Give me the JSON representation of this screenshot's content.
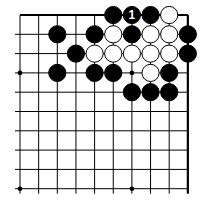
{
  "board": {
    "title": "Go problem diagram (corner)",
    "columns": 10,
    "rows": 10,
    "origin_x": 20,
    "origin_y": 15,
    "spacing_x": 18.65,
    "spacing_y": 19.3,
    "line_color": "#000000",
    "black_color": "#000000",
    "white_color": "#ffffff",
    "star_points": [
      [
        0,
        3
      ],
      [
        6,
        3
      ],
      [
        0,
        9
      ],
      [
        6,
        9
      ]
    ],
    "stones": [
      {
        "col": 5,
        "row": 0,
        "color": "black"
      },
      {
        "col": 6,
        "row": 0,
        "color": "black",
        "label": "1"
      },
      {
        "col": 7,
        "row": 0,
        "color": "black"
      },
      {
        "col": 8,
        "row": 0,
        "color": "white"
      },
      {
        "col": 2,
        "row": 1,
        "color": "black"
      },
      {
        "col": 4,
        "row": 1,
        "color": "black"
      },
      {
        "col": 5,
        "row": 1,
        "color": "white"
      },
      {
        "col": 6,
        "row": 1,
        "color": "black"
      },
      {
        "col": 7,
        "row": 1,
        "color": "white"
      },
      {
        "col": 8,
        "row": 1,
        "color": "white"
      },
      {
        "col": 9,
        "row": 1,
        "color": "black"
      },
      {
        "col": 3,
        "row": 2,
        "color": "black"
      },
      {
        "col": 4,
        "row": 2,
        "color": "white"
      },
      {
        "col": 5,
        "row": 2,
        "color": "white"
      },
      {
        "col": 6,
        "row": 2,
        "color": "white"
      },
      {
        "col": 7,
        "row": 2,
        "color": "white"
      },
      {
        "col": 8,
        "row": 2,
        "color": "white"
      },
      {
        "col": 9,
        "row": 2,
        "color": "black"
      },
      {
        "col": 2,
        "row": 3,
        "color": "black"
      },
      {
        "col": 4,
        "row": 3,
        "color": "black"
      },
      {
        "col": 5,
        "row": 3,
        "color": "black"
      },
      {
        "col": 7,
        "row": 3,
        "color": "white"
      },
      {
        "col": 8,
        "row": 3,
        "color": "black"
      },
      {
        "col": 6,
        "row": 4,
        "color": "black"
      },
      {
        "col": 7,
        "row": 4,
        "color": "black"
      },
      {
        "col": 8,
        "row": 4,
        "color": "black"
      }
    ]
  }
}
